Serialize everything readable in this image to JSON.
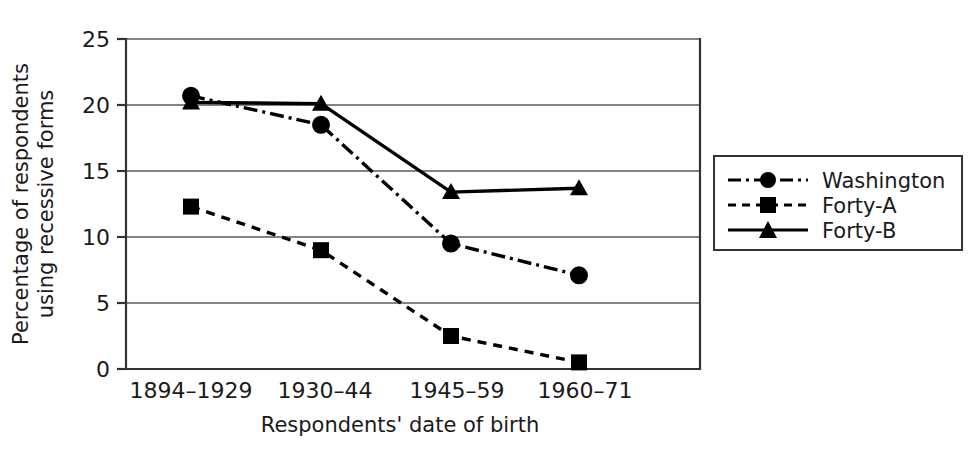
{
  "chart_data": {
    "type": "line",
    "title": "",
    "xlabel": "Respondents' date of birth",
    "ylabel_line1": "Percentage of respondents",
    "ylabel_line2": "using recessive forms",
    "categories": [
      "1894–1929",
      "1930–44",
      "1945–59",
      "1960–71"
    ],
    "yticks": [
      "0",
      "5",
      "10",
      "15",
      "20",
      "25"
    ],
    "ytick_values": [
      0,
      5,
      10,
      15,
      20,
      25
    ],
    "ylim": [
      0,
      25
    ],
    "grid": true,
    "legend_position": "right",
    "series": [
      {
        "name": "Washington",
        "values": [
          20.7,
          18.5,
          9.5,
          7.1
        ],
        "marker": "circle",
        "line_style": "dash-dot",
        "color": "#000000"
      },
      {
        "name": "Forty-A",
        "values": [
          12.3,
          9.0,
          2.5,
          0.5
        ],
        "marker": "square",
        "line_style": "dashed",
        "color": "#000000"
      },
      {
        "name": "Forty-B",
        "values": [
          20.2,
          20.1,
          13.4,
          13.7
        ],
        "marker": "triangle",
        "line_style": "solid",
        "color": "#000000"
      }
    ]
  },
  "legend": {
    "items": [
      {
        "label": "Washington",
        "marker": "circle-marker-icon",
        "line_style": "dash-dot"
      },
      {
        "label": "Forty-A",
        "marker": "square-marker-icon",
        "line_style": "dashed"
      },
      {
        "label": "Forty-B",
        "marker": "triangle-marker-icon",
        "line_style": "solid"
      }
    ]
  },
  "colors": {
    "ink": "#1a1a1a",
    "line": "#000000",
    "grid": "#5a5a5a",
    "axis": "#333333",
    "background": "#ffffff"
  }
}
